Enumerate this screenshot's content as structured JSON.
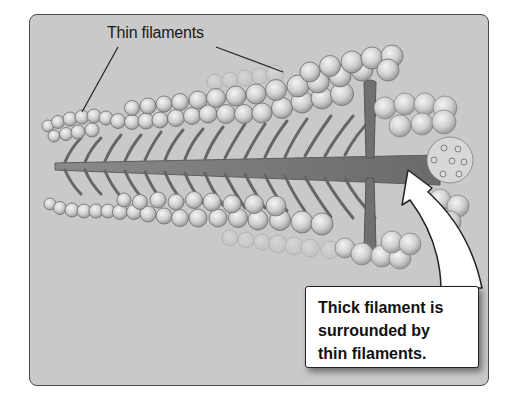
{
  "figure": {
    "type": "scientific-illustration",
    "labels": {
      "thin_filaments": "Thin filaments",
      "callout_lines": [
        "Thick filament is",
        "surrounded by",
        "thin filaments."
      ]
    },
    "colors": {
      "frame_background": "#c9c9c9",
      "frame_border": "#4a4a4a",
      "bead_fill": "#d6d6d6",
      "bead_stroke": "#7a7a7a",
      "thick_filament": "#6e6e6e",
      "callout_background": "#ffffff"
    }
  }
}
